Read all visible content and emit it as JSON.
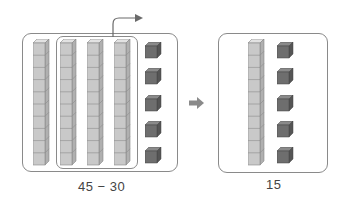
{
  "left_panel": {
    "rods": 4,
    "rods_grouped_for_removal": 3,
    "unit_cubes": 5,
    "expression": "45 − 30"
  },
  "transition_arrow": "right-arrow",
  "right_panel": {
    "rods": 1,
    "unit_cubes": 5,
    "result": "15"
  },
  "colors": {
    "rod_face": "#c9c9c9",
    "rod_side": "#b0b0b0",
    "rod_top": "#e2e2e2",
    "cube_face": "#6e6e6e",
    "cube_side": "#555555",
    "cube_top": "#8a8a8a",
    "border": "#8a8a8a",
    "arrow": "#7a7a7a"
  }
}
